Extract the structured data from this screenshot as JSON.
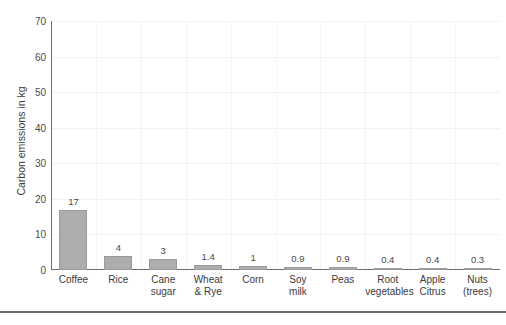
{
  "chart_data": {
    "type": "bar",
    "title": "",
    "xlabel": "",
    "ylabel": "Carbon emissions in kg",
    "ylim": [
      0,
      70
    ],
    "yticks": [
      "0",
      "10",
      "20",
      "30",
      "40",
      "50",
      "60",
      "70"
    ],
    "grid": true,
    "legend": null,
    "bar_color": "#adadad",
    "bar_edge_color": "#9a9a9a",
    "axis_color": "#6e6e6e",
    "grid_color": "#f2f2f2",
    "categories": [
      "Coffee",
      "Rice",
      "Cane sugar",
      "Wheat & Rye",
      "Corn",
      "Soy milk",
      "Peas",
      "Root vegetables",
      "Apple Citrus",
      "Nuts (trees)"
    ],
    "category_lines": [
      {
        "line1": "Coffee",
        "line2": ""
      },
      {
        "line1": "Rice",
        "line2": ""
      },
      {
        "line1": "Cane",
        "line2": "sugar"
      },
      {
        "line1": "Wheat",
        "line2": "& Rye"
      },
      {
        "line1": "Corn",
        "line2": ""
      },
      {
        "line1": "Soy",
        "line2": "milk"
      },
      {
        "line1": "Peas",
        "line2": ""
      },
      {
        "line1": "Root",
        "line2": "vegetables"
      },
      {
        "line1": "Apple",
        "line2": "Citrus"
      },
      {
        "line1": "Nuts",
        "line2": "(trees)"
      }
    ],
    "values": [
      17,
      4,
      3,
      1.4,
      1,
      0.9,
      0.9,
      0.4,
      0.4,
      0.3
    ],
    "value_labels": [
      "17",
      "4",
      "3",
      "1.4",
      "1",
      "0.9",
      "0.9",
      "0.4",
      "0.4",
      "0.3"
    ]
  }
}
